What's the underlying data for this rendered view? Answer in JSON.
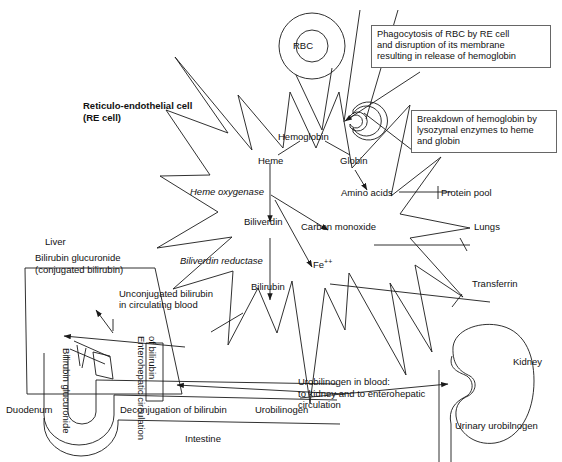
{
  "figure": {
    "background_color": "#ffffff",
    "line_color": "#1a1a1a"
  },
  "cell": {
    "name_line1": "Reticulo-endothelial cell",
    "name_line2": "(RE cell)",
    "rbc_label": "RBC"
  },
  "callouts": [
    {
      "id": "phagocytosis",
      "text": "Phagocytosis of RBC by RE cell\nand disruption of its membrane\nresulting in release of hemoglobin"
    },
    {
      "id": "breakdown",
      "text": "Breakdown of hemoglobin by\nlysozymal enzymes to heme\nand globin"
    }
  ],
  "metabolites": {
    "hemoglobin": "Hemoglobin",
    "heme": "Heme",
    "globin": "Globin",
    "amino_acids": "Amino acids",
    "protein_pool": "Protein pool",
    "biliverdin": "Biliverdin",
    "carbon_monoxide": "Carbon monoxide",
    "lungs": "Lungs",
    "iron": "Fe",
    "iron_charge": "++",
    "transferrin": "Transferrin",
    "bilirubin": "Bilirubin"
  },
  "enzymes": {
    "heme_oxygenase": "Heme oxygenase",
    "biliverdin_reductase": "Biliverdin reductase"
  },
  "blood": {
    "unconjugated_line1": "Unconjugated bilirubin",
    "unconjugated_line2": "in circulating blood"
  },
  "liver": {
    "organ_label": "Liver",
    "content_line1": "Bilirubin glucuronide",
    "content_line2": "(conjugated bilirubin)"
  },
  "gut": {
    "duodenum_label": "Duodenum",
    "bile_duct_label": "Bilirubin glucuronide",
    "enterohepatic_line1": "Enterohepatic circulation",
    "enterohepatic_line2": "of bilirubin",
    "deconjugation_label": "Deconjugation of bilirubin",
    "urobilinogen_label": "Urobilinogen",
    "intestine_label": "Intestine"
  },
  "kidney": {
    "organ_label": "Kidney",
    "urine_label": "Urinary urobilnogen",
    "blood_note": "Urobilinogen in blood:\nto kidney and to enterohepatic\ncirculation"
  }
}
